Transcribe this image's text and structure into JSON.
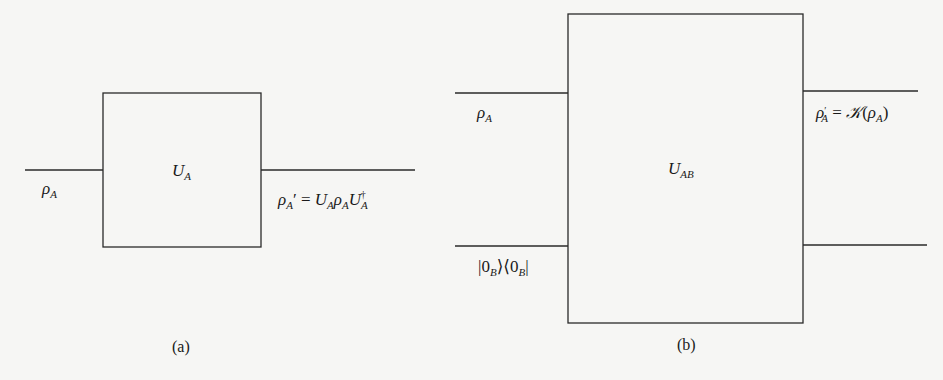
{
  "panel_a": {
    "caption": "(a)",
    "gate_label": "U",
    "gate_sub": "A",
    "input_label": "ρ",
    "input_sub": "A",
    "output_lhs": "ρ",
    "output_lhs_sub": "A",
    "output_prime": "′",
    "output_eq": " = ",
    "output_rhs_u1": "U",
    "output_rhs_u1_sub": "A",
    "output_rhs_rho": "ρ",
    "output_rhs_rho_sub": "A",
    "output_rhs_u2": "U",
    "output_rhs_u2_sub": "A",
    "output_rhs_u2_sup": "†"
  },
  "panel_b": {
    "caption": "(b)",
    "gate_label": "U",
    "gate_sub": "AB",
    "input_top_label": "ρ",
    "input_top_sub": "A",
    "input_bottom_ket_open": "|0",
    "input_bottom_ket_sub": "B",
    "input_bottom_mid": "⟩⟨0",
    "input_bottom_bra_sub": "B",
    "input_bottom_close": "|",
    "output_top_lhs": "ρ",
    "output_top_prime": "′",
    "output_top_lhs_sub": "A",
    "output_top_eq": " = ",
    "output_top_channel": "𝒦",
    "output_top_open": "(",
    "output_top_arg": "ρ",
    "output_top_arg_sub": "A",
    "output_top_close": ")"
  },
  "colors": {
    "line": "#2a2a2a",
    "background": "#f6f6f4"
  }
}
